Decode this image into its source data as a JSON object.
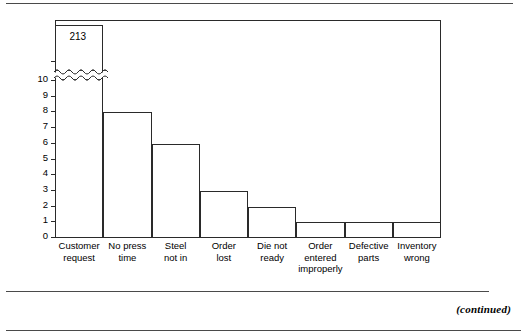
{
  "page": {
    "continued_note": "(continued)"
  },
  "chart_data": {
    "type": "bar",
    "title": "",
    "subtitle": "",
    "xlabel": "",
    "ylabel": "",
    "ylim": [
      0,
      11
    ],
    "grid": false,
    "legend": "none",
    "axis_break": {
      "present": true,
      "style": "double-wavy",
      "location_value": 10.4,
      "note": "y-axis is broken above 10 so the 213-count bar can be shown truncated"
    },
    "categories": [
      "Customer\nrequest",
      "No press\ntime",
      "Steel\nnot in",
      "Order\nlost",
      "Die not\nready",
      "Order\nentered\nimproperly",
      "Defective\nparts",
      "Inventory\nwrong"
    ],
    "values": [
      213,
      8,
      6,
      3,
      2,
      1,
      1,
      1
    ],
    "data_labels": [
      "213",
      "",
      "",
      "",
      "",
      "",
      "",
      ""
    ],
    "yticks": [
      0,
      1,
      2,
      3,
      4,
      5,
      6,
      7,
      8,
      9,
      10
    ],
    "ytick_labels": [
      "0",
      "1",
      "2",
      "3",
      "4",
      "5",
      "6",
      "7",
      "8",
      "9",
      "10"
    ],
    "bar_style": {
      "fill": "#ffffff",
      "edge": "#2a2a2a",
      "gap": 0
    }
  },
  "colors": {
    "ink": "#000000",
    "line": "#2a2a2a",
    "rule": "#4a4a4a",
    "background": "#ffffff"
  }
}
